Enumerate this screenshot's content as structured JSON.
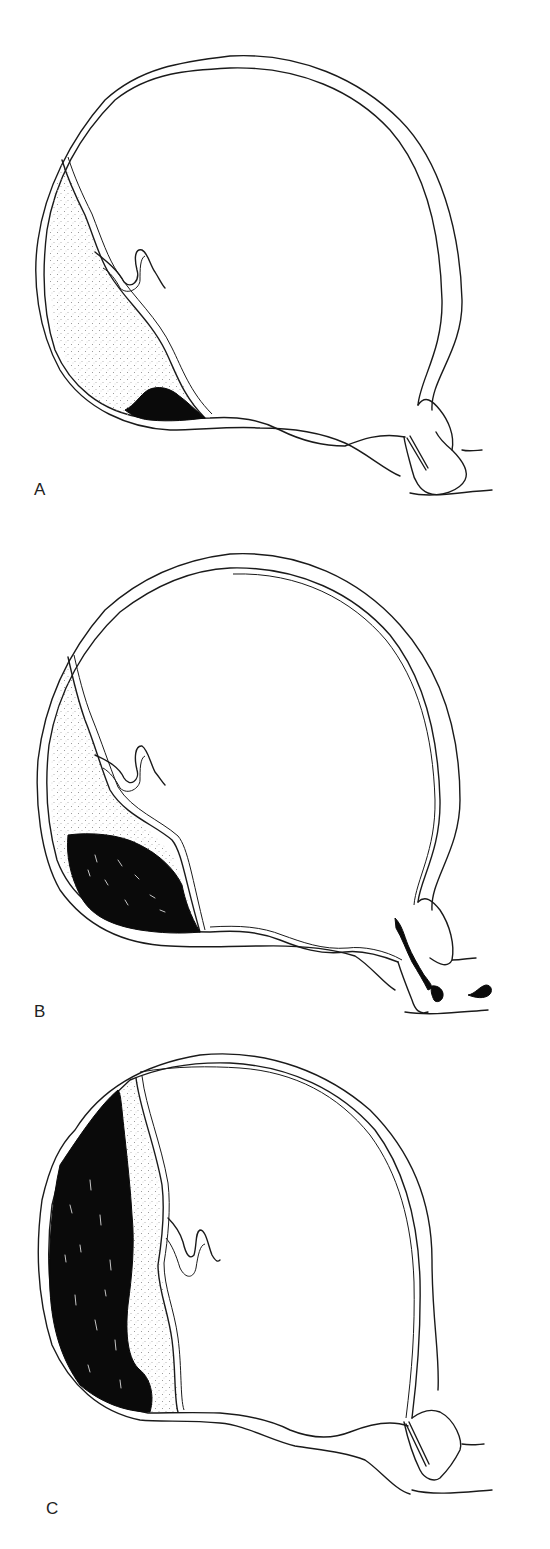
{
  "figure": {
    "panels": [
      {
        "id": "A",
        "label": "A",
        "description": "Small retroplacental hematoma at the lower edge of the placenta; no external bleeding",
        "hematoma_extent": "small",
        "external_bleeding": false
      },
      {
        "id": "B",
        "label": "B",
        "description": "Larger hematoma at the lower placental margin dissecting membranes with external bleeding through the cervix",
        "hematoma_extent": "moderate",
        "external_bleeding": true
      },
      {
        "id": "C",
        "label": "C",
        "description": "Large concealed retroplacental hematoma behind most of the placenta; no external bleeding",
        "hematoma_extent": "large",
        "external_bleeding": false
      }
    ],
    "colors": {
      "background": "#ffffff",
      "line": "#1a1a1a",
      "hematoma": "#0a0a0a",
      "placenta_stipple": "#9a9a9a"
    }
  }
}
